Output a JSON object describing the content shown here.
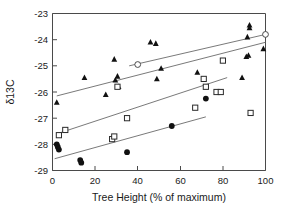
{
  "figure": {
    "background": "#ffffff",
    "width": 283,
    "height": 215
  },
  "axis_titles": {
    "x": "Tree Height (% of maximum)",
    "y": "δ13C"
  },
  "ticks": {
    "x": [
      "0",
      "20",
      "40",
      "60",
      "80",
      "100"
    ],
    "y": [
      "-23",
      "-24",
      "-25",
      "-26",
      "-27",
      "-28",
      "-29"
    ]
  },
  "colors": {
    "marker_filled": "#111111",
    "marker_open_stroke": "#2a2a2a",
    "marker_open_fill": "#ffffff",
    "regression_line": "#6a6a6a",
    "axis": "#4a4a4a",
    "text": "#1a1a1a"
  },
  "chart_data": {
    "type": "scatter",
    "title": "",
    "xlabel": "Tree Height (% of maximum)",
    "ylabel": "δ13C",
    "xlim": [
      0,
      100
    ],
    "ylim": [
      -29,
      -23
    ],
    "xticks": [
      0,
      20,
      40,
      60,
      80,
      100
    ],
    "yticks": [
      -29,
      -28,
      -27,
      -26,
      -25,
      -24,
      -23
    ],
    "grid": false,
    "legend": "none",
    "series": [
      {
        "name": "filled-triangles",
        "marker": "triangle",
        "fill": "solid",
        "points": [
          [
            2,
            -26.4
          ],
          [
            15,
            -25.45
          ],
          [
            25,
            -26.1
          ],
          [
            29,
            -24.75
          ],
          [
            29.5,
            -25.55
          ],
          [
            30.5,
            -25.4
          ],
          [
            31,
            -25.8
          ],
          [
            46,
            -24.1
          ],
          [
            48.5,
            -24.15
          ],
          [
            49,
            -25.5
          ],
          [
            51,
            -25.1
          ],
          [
            68,
            -25.25
          ],
          [
            89,
            -25.45
          ],
          [
            91,
            -24.65
          ],
          [
            92,
            -24.6
          ],
          [
            91.5,
            -23.9
          ],
          [
            92.5,
            -23.45
          ],
          [
            92.5,
            -23.55
          ],
          [
            99,
            -24.35
          ]
        ]
      },
      {
        "name": "open-squares",
        "marker": "square",
        "fill": "open",
        "points": [
          [
            3,
            -27.65
          ],
          [
            6,
            -27.45
          ],
          [
            28,
            -27.8
          ],
          [
            29,
            -27.7
          ],
          [
            30.5,
            -25.8
          ],
          [
            35,
            -27.0
          ],
          [
            67,
            -26.6
          ],
          [
            71,
            -25.5
          ],
          [
            72,
            -25.8
          ],
          [
            77,
            -26.0
          ],
          [
            79,
            -26.0
          ],
          [
            80,
            -24.8
          ],
          [
            93,
            -26.8
          ]
        ]
      },
      {
        "name": "filled-circles",
        "marker": "circle",
        "fill": "solid",
        "points": [
          [
            2,
            -28.0
          ],
          [
            2.5,
            -28.1
          ],
          [
            3,
            -28.2
          ],
          [
            13,
            -28.6
          ],
          [
            13.5,
            -28.7
          ],
          [
            35,
            -28.3
          ],
          [
            56,
            -27.3
          ],
          [
            72,
            -26.25
          ]
        ]
      },
      {
        "name": "open-circles",
        "marker": "circle",
        "fill": "open",
        "points": [
          [
            40,
            -24.95
          ],
          [
            100,
            -23.8
          ]
        ]
      }
    ],
    "fit_lines": [
      {
        "name": "triangles-fit",
        "x0": 2,
        "y0": -26.15,
        "x1": 100,
        "y1": -24.1
      },
      {
        "name": "open-circles-fit",
        "x0": 36,
        "y0": -25.0,
        "x1": 100,
        "y1": -23.8
      },
      {
        "name": "squares-fit",
        "x0": 2,
        "y0": -27.6,
        "x1": 82,
        "y1": -25.45
      },
      {
        "name": "circles-fit",
        "x0": 1,
        "y0": -28.55,
        "x1": 72,
        "y1": -26.95
      }
    ]
  }
}
